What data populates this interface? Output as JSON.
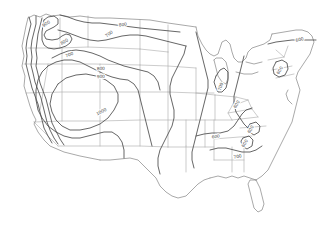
{
  "figure": {
    "title": "",
    "region": "Continental United States",
    "background_color": "#ffffff",
    "contour_color": "#4a4a4a",
    "boundary_color": "#a9a9a9"
  },
  "chart_data": {
    "type": "contour-map",
    "title": "",
    "subtitle": "",
    "xlabel": "",
    "ylabel": "",
    "grid": false,
    "legend": "none",
    "units": "",
    "contour_interval": 100,
    "value_range": [
      600,
      1000
    ],
    "levels": [
      600,
      700,
      800,
      900,
      1000
    ],
    "labels": [
      {
        "id": "lbl-pnw-900",
        "text": "900",
        "x": 47,
        "y": 25,
        "rotate": -32,
        "level": 900,
        "region": "Pacific Northwest interior"
      },
      {
        "id": "lbl-n-border-800",
        "text": "800",
        "x": 123,
        "y": 26,
        "rotate": -6,
        "level": 800,
        "region": "Northern border / Montana"
      },
      {
        "id": "lbl-n-border-700",
        "text": "700",
        "x": 110,
        "y": 35,
        "rotate": -38,
        "level": 700,
        "region": "Northern border / North Dakota"
      },
      {
        "id": "lbl-idaho-800",
        "text": "800",
        "x": 65,
        "y": 43,
        "rotate": -30,
        "level": 800,
        "region": "Idaho / Montana"
      },
      {
        "id": "lbl-wyo-700",
        "text": "700",
        "x": 70,
        "y": 56,
        "rotate": -22,
        "level": 700,
        "region": "Wyoming / Dakotas"
      },
      {
        "id": "lbl-plains-800",
        "text": "800",
        "x": 101,
        "y": 70,
        "rotate": -4,
        "level": 800,
        "region": "Central plains"
      },
      {
        "id": "lbl-plains-900",
        "text": "900",
        "x": 101,
        "y": 78,
        "rotate": -3,
        "level": 900,
        "region": "Central plains"
      },
      {
        "id": "lbl-southwest-1000",
        "text": "1000",
        "x": 102,
        "y": 113,
        "rotate": -26,
        "level": 1000,
        "region": "Desert Southwest"
      },
      {
        "id": "lbl-greatlakes-700",
        "text": "700",
        "x": 222,
        "y": 87,
        "rotate": -72,
        "level": 700,
        "region": "Michigan / Great Lakes"
      },
      {
        "id": "lbl-appalachia-600",
        "text": "600",
        "x": 238,
        "y": 105,
        "rotate": -62,
        "level": 600,
        "region": "Appalachians / Pennsylvania"
      },
      {
        "id": "lbl-maine-600",
        "text": "600",
        "x": 300,
        "y": 41,
        "rotate": -13,
        "level": 600,
        "region": "Maine / Northeast"
      },
      {
        "id": "lbl-newengland-600",
        "text": "600",
        "x": 281,
        "y": 71,
        "rotate": -58,
        "level": 600,
        "region": "New England closed high"
      },
      {
        "id": "lbl-tennessee-600",
        "text": "600",
        "x": 216,
        "y": 138,
        "rotate": -8,
        "level": 600,
        "region": "Tennessee / Mississippi valley"
      },
      {
        "id": "lbl-carolina-600a",
        "text": "600",
        "x": 252,
        "y": 130,
        "rotate": -62,
        "level": 600,
        "region": "North Carolina closed cell"
      },
      {
        "id": "lbl-carolina-600b",
        "text": "600",
        "x": 246,
        "y": 144,
        "rotate": -58,
        "level": 600,
        "region": "South Carolina closed cell"
      },
      {
        "id": "lbl-georgia-700",
        "text": "700",
        "x": 238,
        "y": 158,
        "rotate": -12,
        "level": 700,
        "region": "Georgia / Southeast"
      }
    ]
  }
}
